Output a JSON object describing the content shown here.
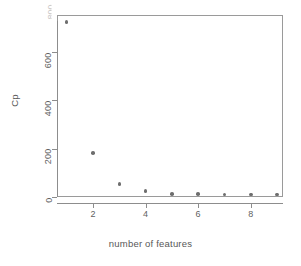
{
  "chart_data": {
    "type": "scatter",
    "title": "",
    "xlabel": "number of features",
    "ylabel": "Cp",
    "x": [
      1,
      2,
      3,
      4,
      5,
      6,
      7,
      8,
      9
    ],
    "values": [
      725,
      182,
      54,
      25,
      12,
      12,
      10,
      10,
      10
    ],
    "series": [
      {
        "name": "Cp",
        "values": [
          725,
          182,
          54,
          25,
          12,
          12,
          10,
          10,
          10
        ]
      }
    ],
    "xlim": [
      0.7,
      9.3
    ],
    "ylim": [
      -20,
      755
    ],
    "xticks": [
      2,
      4,
      6,
      8
    ],
    "yticks": [
      0,
      200,
      400,
      600
    ],
    "xtick_labels": [
      "2",
      "4",
      "6",
      "8"
    ],
    "ytick_labels": [
      "0",
      "200",
      "400",
      "600"
    ],
    "grid": false,
    "legend": null,
    "legend_position": "none",
    "point_color": "#6e6e6e",
    "axis_color": "#8d8d8d",
    "frame": true,
    "annotations": []
  },
  "axis": {
    "x_title": "number of features",
    "y_title": "Cp",
    "clipped_top_label": "800"
  },
  "colors": {
    "background": "#ffffff",
    "axis": "#8d8d8d",
    "frame": "#9a9a9a",
    "point": "#6e6e6e",
    "text": "#5f5f5f"
  }
}
